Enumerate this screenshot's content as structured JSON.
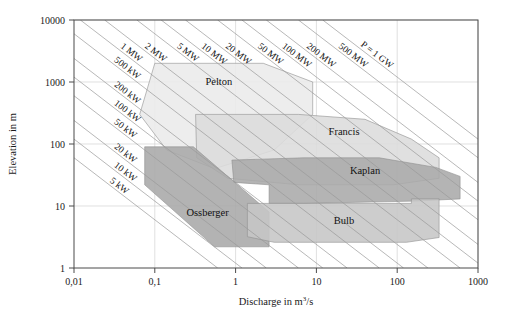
{
  "chart_data": {
    "type": "area",
    "title": "",
    "xlabel": "Discharge in m",
    "xlabel_sup": "3",
    "xlabel_tail": "/s",
    "ylabel": "Elevation in m",
    "xscale": "log",
    "yscale": "log",
    "xlim": [
      0.01,
      1000
    ],
    "ylim": [
      1,
      10000
    ],
    "grid": true,
    "legend_position": "inline-labels",
    "x_ticks": [
      "0,01",
      "0,1",
      "1",
      "10",
      "100",
      "1000"
    ],
    "x_tick_values": [
      0.01,
      0.1,
      1,
      10,
      100,
      1000
    ],
    "y_ticks": [
      "1",
      "10",
      "100",
      "1000",
      "10000"
    ],
    "y_tick_values": [
      1,
      10,
      100,
      1000,
      10000
    ],
    "power_lines": [
      {
        "label": "5 kW",
        "kw": 5
      },
      {
        "label": "10 kW",
        "kw": 10
      },
      {
        "label": "20 kW",
        "kw": 20
      },
      {
        "label": "50 kW",
        "kw": 50
      },
      {
        "label": "100 kW",
        "kw": 100
      },
      {
        "label": "200 kW",
        "kw": 200
      },
      {
        "label": "500 kW",
        "kw": 500
      },
      {
        "label": "1 MW",
        "kw": 1000
      },
      {
        "label": "2 MW",
        "kw": 2000
      },
      {
        "label": "5 MW",
        "kw": 5000
      },
      {
        "label": "10 MW",
        "kw": 10000
      },
      {
        "label": "20 MW",
        "kw": 20000
      },
      {
        "label": "50 MW",
        "kw": 50000
      },
      {
        "label": "100 MW",
        "kw": 100000
      },
      {
        "label": "200 MW",
        "kw": 200000
      },
      {
        "label": "500 MW",
        "kw": 500000
      },
      {
        "label": "P = 1 GW",
        "kw": 1000000
      }
    ],
    "series": [
      {
        "name": "Pelton",
        "color": "#eaeaea",
        "label_x": 0.62,
        "label_y": 900,
        "polygon": [
          [
            0.1,
            2000
          ],
          [
            2.2,
            2000
          ],
          [
            9.0,
            1000
          ],
          [
            9.0,
            300
          ],
          [
            3.0,
            80
          ],
          [
            0.55,
            40
          ],
          [
            0.14,
            80
          ],
          [
            0.065,
            300
          ]
        ]
      },
      {
        "name": "Francis",
        "color": "#dcdcdc",
        "label_x": 22,
        "label_y": 140,
        "polygon": [
          [
            0.32,
            300
          ],
          [
            6.0,
            300
          ],
          [
            40,
            250
          ],
          [
            150,
            120
          ],
          [
            330,
            60
          ],
          [
            330,
            28
          ],
          [
            90,
            22
          ],
          [
            6.0,
            22
          ],
          [
            0.8,
            28
          ],
          [
            0.33,
            60
          ]
        ]
      },
      {
        "name": "Kaplan",
        "color": "#aaaaaa",
        "label_x": 40,
        "label_y": 33,
        "polygon": [
          [
            0.9,
            55
          ],
          [
            7.0,
            60
          ],
          [
            60,
            60
          ],
          [
            300,
            42
          ],
          [
            600,
            30
          ],
          [
            600,
            13
          ],
          [
            170,
            12
          ],
          [
            7.0,
            11
          ],
          [
            2.6,
            11
          ],
          [
            2.6,
            22
          ],
          [
            0.95,
            24
          ]
        ]
      },
      {
        "name": "Ossberger",
        "color": "#a8a8a8",
        "label_x": 0.45,
        "label_y": 7.0,
        "polygon": [
          [
            0.075,
            90
          ],
          [
            0.3,
            90
          ],
          [
            2.6,
            8.0
          ],
          [
            2.6,
            2.2
          ],
          [
            0.55,
            2.2
          ],
          [
            0.075,
            22
          ]
        ]
      },
      {
        "name": "Bulb",
        "color": "#c6c6c6",
        "label_x": 22,
        "label_y": 5.2,
        "polygon": [
          [
            1.4,
            11
          ],
          [
            150,
            11
          ],
          [
            150,
            13
          ],
          [
            330,
            13
          ],
          [
            330,
            3.1
          ],
          [
            130,
            2.6
          ],
          [
            3.0,
            2.6
          ],
          [
            1.4,
            3.2
          ]
        ]
      }
    ]
  },
  "figure": {
    "background": "#ffffff",
    "frame_color": "#4a4a4a",
    "grid_color": "#d2d2d2",
    "powerline_color": "#9a9a9a"
  }
}
